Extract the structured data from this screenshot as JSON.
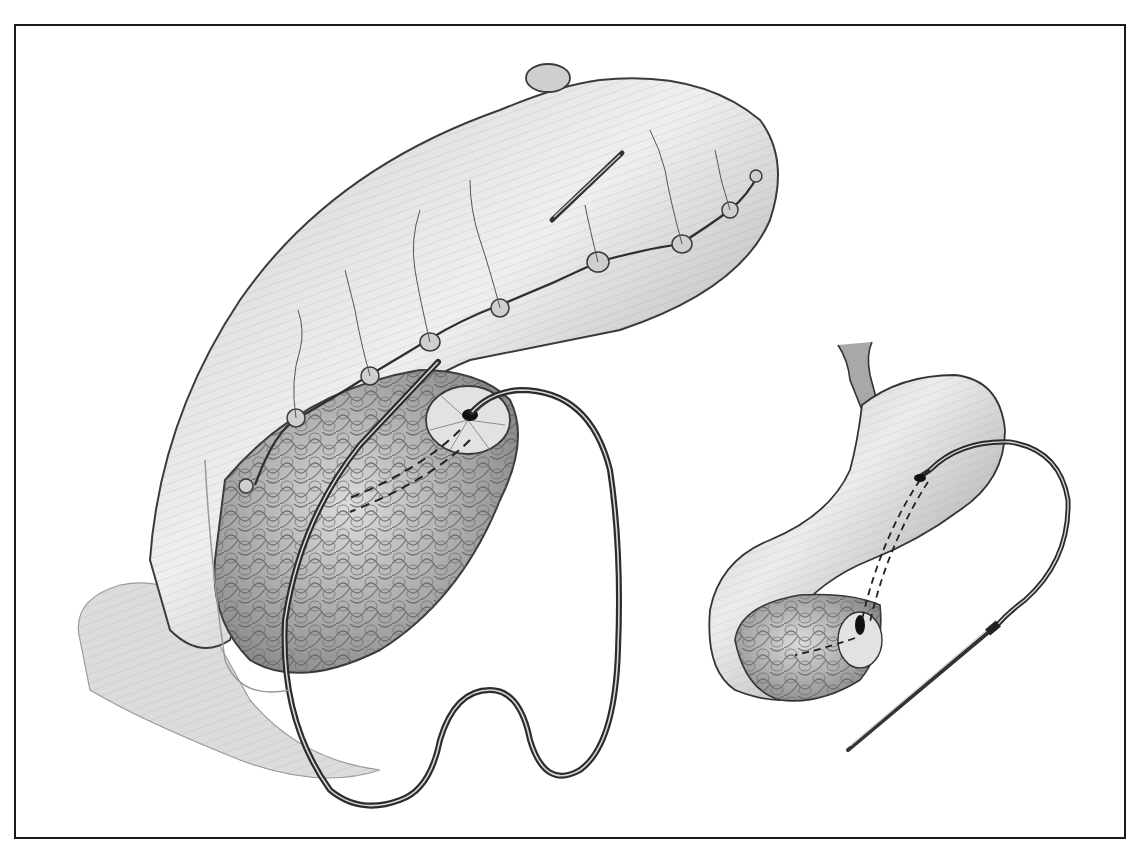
{
  "figure": {
    "kind": "surgical-illustration",
    "style": "grayscale pencil/halftone medical drawing",
    "frame": {
      "x": 14,
      "y": 24,
      "width": 1112,
      "height": 815,
      "stroke": "#1a1a1a"
    },
    "colors": {
      "background": "#ffffff",
      "tissue_light": "#e4e4e4",
      "tissue_mid": "#b5b5b5",
      "tissue_dark": "#6e6e6e",
      "outline": "#2a2a2a",
      "catheter": "#333333",
      "catheter_highlight": "#d8d8d8",
      "needle": "#444444"
    },
    "main_view": {
      "structures": [
        "jejunal-loop",
        "pancreas",
        "pancreatic-duct-anastomosis",
        "interrupted-sutures",
        "stent-catheter",
        "straight-needle"
      ],
      "suture_count": 9
    },
    "inset_view": {
      "structures": [
        "stomach",
        "pancreas-stump",
        "catheter",
        "trocar-needle"
      ]
    }
  }
}
